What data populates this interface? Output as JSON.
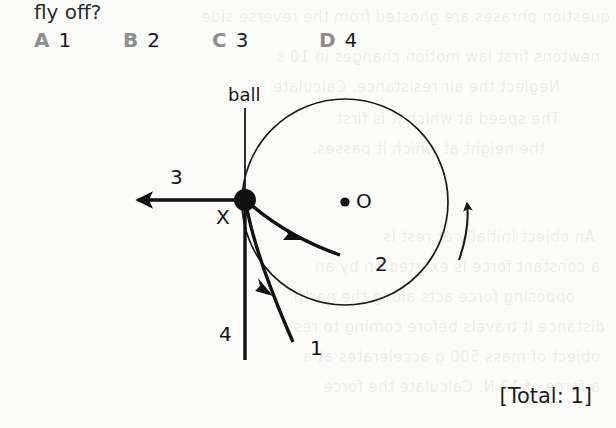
{
  "page": {
    "background_color": "#fbfbfa",
    "ink_color": "#1a1a1a"
  },
  "question": {
    "stem_text": "fly off?",
    "options": [
      {
        "letter": "A",
        "value": "1"
      },
      {
        "letter": "B",
        "value": "2"
      },
      {
        "letter": "C",
        "value": "3"
      },
      {
        "letter": "D",
        "value": "4"
      }
    ],
    "option_letter_color": "#8e8e8e"
  },
  "figure": {
    "ball_label": "ball",
    "centre_label": "O",
    "point_label": "X",
    "direction_labels": {
      "one": "1",
      "two": "2",
      "three": "3",
      "four": "4"
    },
    "rotation_indicator": "curved-arrow-anticlockwise"
  },
  "footer": {
    "total_marks": "[Total: 1]"
  },
  "ghost_text": {
    "lines": [
      "question phrases are ghosted from the reverse side",
      "newtons first law motion changes in 10 s",
      "Neglect the air resistance. Calculate",
      "The speed at which it is first",
      "the height at which it passes.",
      "An object initially at rest is",
      "a constant force is exerted on by an",
      "opposing force acts along the north",
      "distance it travels before coming to rest",
      "object of mass 500 g accelerates at a",
      "a force of 12 N. Calculate the force"
    ]
  }
}
